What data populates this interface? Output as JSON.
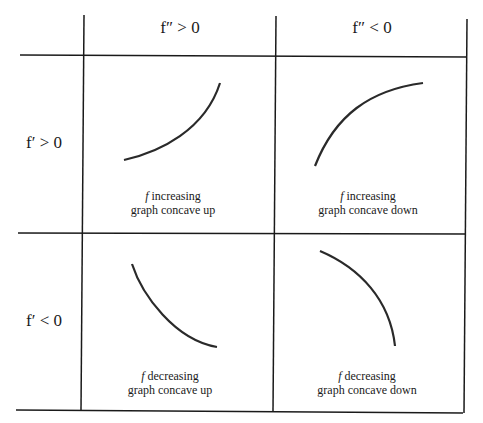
{
  "table": {
    "column_headers": [
      "f″ > 0",
      "f″ < 0"
    ],
    "row_headers": [
      "f′ > 0",
      "f′ < 0"
    ],
    "cells": [
      {
        "row": 0,
        "col": 0,
        "f": "f",
        "line1": " increasing",
        "line2": "graph concave up",
        "curve": "increasing-concave-up"
      },
      {
        "row": 0,
        "col": 1,
        "f": "f",
        "line1": " increasing",
        "line2": "graph concave down",
        "curve": "increasing-concave-down"
      },
      {
        "row": 1,
        "col": 0,
        "f": "f",
        "line1": " decreasing",
        "line2": "graph concave up",
        "curve": "decreasing-concave-up"
      },
      {
        "row": 1,
        "col": 1,
        "f": "f",
        "line1": " decreasing",
        "line2": "graph concave down",
        "curve": "decreasing-concave-down"
      }
    ]
  },
  "colors": {
    "line": "#1a1a1a",
    "curve": "#2a2a2a",
    "background": "#ffffff"
  }
}
